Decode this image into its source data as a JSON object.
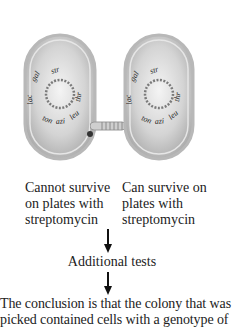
{
  "diagram": {
    "left_cell": {
      "genes": [
        "str",
        "gal",
        "lac",
        "ton",
        "azi",
        "leu",
        "thr"
      ],
      "caption_lines": [
        "Cannot survive",
        "on plates with",
        "streptomycin"
      ]
    },
    "right_cell": {
      "genes": [
        "str",
        "gal",
        "lac",
        "ton",
        "azi",
        "leu",
        "thr"
      ],
      "caption_lines": [
        "Can survive on",
        "plates with",
        "streptomycin"
      ]
    },
    "step_label": "Additional tests",
    "conclusion_lines": [
      "The conclusion is that the colony that was",
      "picked contained cells with a genotype of"
    ],
    "colors": {
      "cell_fill": "#d9d9d9",
      "cell_rim": "#bdbdbd",
      "arrow": "#111111",
      "text": "#222222"
    }
  }
}
